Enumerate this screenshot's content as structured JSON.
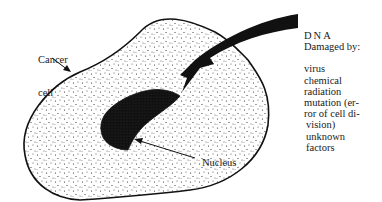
{
  "labels": {
    "cancer_cell": [
      "Cancer",
      "cell"
    ],
    "nucleus": "Nucleus",
    "dna_title": "DNA",
    "damaged_by": "Damaged by:",
    "causes": [
      "virus",
      "chemical",
      "radiation",
      "mutation (er-",
      "ror of cell di-",
      "vision)",
      "unknown",
      "factors"
    ]
  },
  "colors": {
    "ink": "#111111",
    "background": "#ffffff"
  }
}
